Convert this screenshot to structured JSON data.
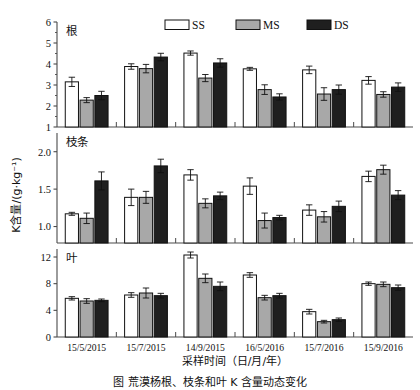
{
  "figure": {
    "ylabel": "K含量/(g·kg⁻¹)",
    "xlabel": "采样时间（日/月/年）",
    "caption": "图     荒漠杨根、枝条和叶 K 含量动态变化"
  },
  "legend": {
    "position": "top-center",
    "items": [
      {
        "label": "SS",
        "color": "#ffffff"
      },
      {
        "label": "MS",
        "color": "#a8a8a8"
      },
      {
        "label": "DS",
        "color": "#1f1f1f"
      }
    ]
  },
  "chart_data": [
    {
      "type": "bar",
      "panel_label": "根",
      "title": "",
      "xlabel": "",
      "ylabel": "K含量/(g·kg⁻¹)",
      "categories": [
        "15/5/2015",
        "15/7/2015",
        "14/9/2015",
        "16/5/2016",
        "15/7/2016",
        "15/9/2016"
      ],
      "ylim": [
        1,
        6
      ],
      "yticks": [
        1,
        2,
        3,
        4,
        5,
        6
      ],
      "ytick_labels": [
        "1",
        "2",
        "3",
        "4",
        "5",
        "6"
      ],
      "grid": false,
      "series": [
        {
          "name": "SS",
          "color": "#ffffff",
          "values": [
            3.15,
            3.88,
            4.52,
            3.77,
            3.72,
            3.22
          ],
          "errors": [
            0.22,
            0.13,
            0.1,
            0.07,
            0.18,
            0.18
          ]
        },
        {
          "name": "MS",
          "color": "#a8a8a8",
          "values": [
            2.28,
            3.78,
            3.33,
            2.78,
            2.57,
            2.55
          ],
          "errors": [
            0.12,
            0.2,
            0.17,
            0.23,
            0.3,
            0.13
          ]
        },
        {
          "name": "DS",
          "color": "#1f1f1f",
          "values": [
            2.5,
            4.33,
            4.05,
            2.43,
            2.78,
            2.9
          ],
          "errors": [
            0.2,
            0.18,
            0.2,
            0.15,
            0.22,
            0.2
          ]
        }
      ]
    },
    {
      "type": "bar",
      "panel_label": "枝条",
      "title": "",
      "xlabel": "",
      "ylabel": "K含量/(g·kg⁻¹)",
      "categories": [
        "15/5/2015",
        "15/7/2015",
        "14/9/2015",
        "16/5/2016",
        "15/7/2016",
        "15/9/2016"
      ],
      "ylim": [
        0.78,
        2.25
      ],
      "yticks": [
        1.0,
        1.5,
        2.0
      ],
      "ytick_labels": [
        "1.0",
        "1.5",
        "2.0"
      ],
      "grid": false,
      "series": [
        {
          "name": "SS",
          "color": "#ffffff",
          "values": [
            1.17,
            1.39,
            1.69,
            1.54,
            1.22,
            1.67
          ],
          "errors": [
            0.02,
            0.11,
            0.07,
            0.11,
            0.07,
            0.07
          ]
        },
        {
          "name": "MS",
          "color": "#a8a8a8",
          "values": [
            1.11,
            1.39,
            1.31,
            1.08,
            1.13,
            1.76
          ],
          "errors": [
            0.07,
            0.08,
            0.06,
            0.1,
            0.07,
            0.06
          ]
        },
        {
          "name": "DS",
          "color": "#1f1f1f",
          "values": [
            1.61,
            1.81,
            1.41,
            1.12,
            1.27,
            1.42
          ],
          "errors": [
            0.12,
            0.09,
            0.05,
            0.03,
            0.07,
            0.06
          ]
        }
      ]
    },
    {
      "type": "bar",
      "panel_label": "叶",
      "title": "",
      "xlabel": "采样时间（日/月/年）",
      "ylabel": "K含量/(g·kg⁻¹)",
      "categories": [
        "15/5/2015",
        "15/7/2015",
        "14/9/2015",
        "16/5/2016",
        "15/7/2016",
        "15/9/2016"
      ],
      "ylim": [
        0,
        13.2
      ],
      "yticks": [
        0,
        4,
        8,
        12
      ],
      "ytick_labels": [
        "0",
        "4",
        "8",
        "12"
      ],
      "grid": false,
      "series": [
        {
          "name": "SS",
          "color": "#ffffff",
          "values": [
            5.8,
            6.3,
            12.3,
            9.3,
            3.8,
            8.0
          ],
          "errors": [
            0.25,
            0.35,
            0.45,
            0.35,
            0.35,
            0.25
          ]
        },
        {
          "name": "MS",
          "color": "#a8a8a8",
          "values": [
            5.4,
            6.6,
            8.8,
            5.9,
            2.3,
            7.9
          ],
          "errors": [
            0.35,
            0.75,
            0.65,
            0.35,
            0.2,
            0.35
          ]
        },
        {
          "name": "DS",
          "color": "#1f1f1f",
          "values": [
            5.5,
            6.2,
            7.6,
            6.2,
            2.6,
            7.4
          ],
          "errors": [
            0.2,
            0.35,
            0.65,
            0.35,
            0.25,
            0.4
          ]
        }
      ]
    }
  ]
}
